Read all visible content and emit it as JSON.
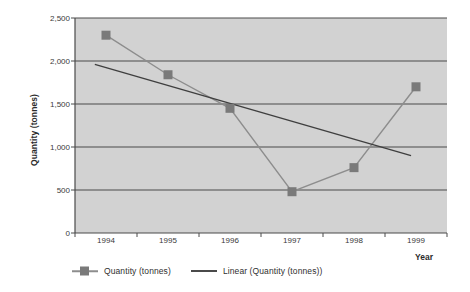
{
  "chart_data": {
    "type": "line",
    "title": "",
    "xlabel": "Year",
    "ylabel": "Quantity (tonnes)",
    "categories": [
      "1994",
      "1995",
      "1996",
      "1997",
      "1998",
      "1999"
    ],
    "series": [
      {
        "name": "Quantity (tonnes)",
        "type": "line-marker",
        "values": [
          2300,
          1840,
          1450,
          480,
          760,
          1700
        ]
      },
      {
        "name": "Linear (Quantity (tonnes))",
        "type": "trendline",
        "endpoints": [
          1960,
          900
        ]
      }
    ],
    "ylim": [
      0,
      2500
    ],
    "yticks": [
      0,
      500,
      1000,
      1500,
      2000,
      2500
    ],
    "ytick_labels": [
      "0",
      "500",
      "1,000",
      "1,500",
      "2,000",
      "2,500"
    ],
    "grid": true,
    "legend_position": "bottom",
    "colors": {
      "plot_background": "#d2d2d2",
      "gridline": "#4a4a4a",
      "axis": "#4a4a4a",
      "series_line": "#8d8d8d",
      "marker": "#7a7a7a",
      "trendline": "#3f3f3f"
    }
  },
  "legend": {
    "entries": [
      {
        "label": "Quantity (tonnes)"
      },
      {
        "label": "Linear (Quantity (tonnes))"
      }
    ]
  },
  "axes": {
    "x_title": "Year",
    "y_title": "Quantity (tonnes)"
  }
}
